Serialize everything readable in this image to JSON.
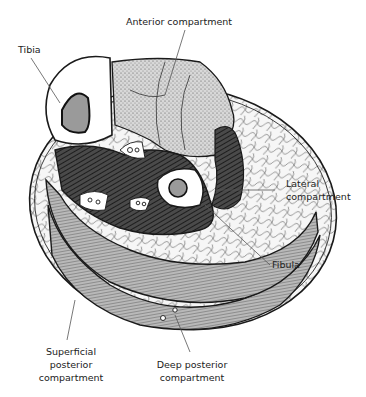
{
  "diagram": {
    "labels": {
      "anterior": "Anterior compartment",
      "tibia": "Tibia",
      "lateral_line1": "Lateral",
      "lateral_line2": "compartment",
      "fibula": "Fibula",
      "superficial_line1": "Superficial",
      "superficial_line2": "posterior",
      "superficial_line3": "compartment",
      "deep_line1": "Deep posterior",
      "deep_line2": "compartment"
    },
    "colors": {
      "ink": "#1a1a1a",
      "dark_muscle": "#3a3a3a",
      "mid_muscle": "#8a8a8a",
      "light_muscle": "#c8c8c8",
      "bone": "#ffffff",
      "marrow": "#9a9a9a",
      "fat": "#f2f2f2",
      "leader": "#555555"
    }
  }
}
